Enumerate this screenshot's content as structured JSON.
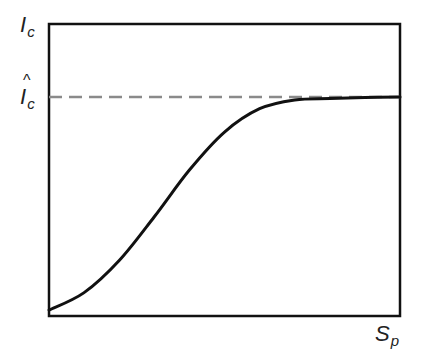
{
  "chart_data": {
    "type": "line",
    "title": "",
    "xlabel": "S_p",
    "ylabel": "I_c",
    "x_label_parts": {
      "main": "S",
      "sub": "p"
    },
    "y_label_parts": {
      "main": "I",
      "sub": "c"
    },
    "reference_line": {
      "label": "Î_c",
      "label_main": "I",
      "label_sub": "c",
      "style": "dashed",
      "color": "#8a8a8a",
      "y_fraction": 0.75
    },
    "series": [
      {
        "name": "I_c vs S_p",
        "color": "#111111",
        "x": [
          0.0,
          0.1,
          0.2,
          0.3,
          0.4,
          0.5,
          0.6,
          0.7,
          0.8,
          0.9,
          1.0
        ],
        "y": [
          0.02,
          0.08,
          0.19,
          0.34,
          0.5,
          0.63,
          0.71,
          0.74,
          0.745,
          0.748,
          0.75
        ]
      }
    ],
    "xlim": [
      0,
      1
    ],
    "ylim": [
      0,
      1
    ],
    "grid": false,
    "legend": null
  },
  "labels": {
    "y_axis_main": "I",
    "y_axis_sub": "c",
    "ref_main": "I",
    "ref_sub": "c",
    "ref_hat": "^",
    "x_axis_main": "S",
    "x_axis_sub": "p"
  }
}
